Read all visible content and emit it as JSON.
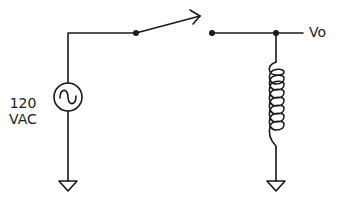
{
  "diagram": {
    "type": "circuit-schematic",
    "source": {
      "label_line1": "120",
      "label_line2": "VAC",
      "symbol": "ac-voltage-source"
    },
    "switch": {
      "symbol": "spst-switch",
      "state": "open"
    },
    "inductor": {
      "symbol": "inductor-coil",
      "turns": 7
    },
    "output": {
      "label": "Vo"
    },
    "grounds": 2,
    "colors": {
      "line": "#1a1a1a",
      "background": "#ffffff"
    }
  }
}
